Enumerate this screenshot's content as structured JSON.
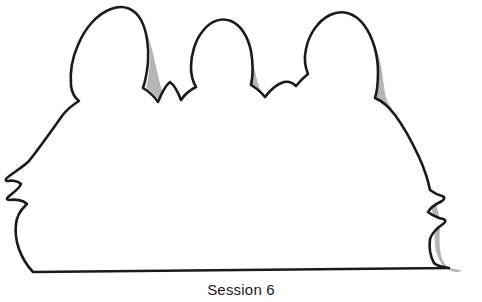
{
  "artwork": {
    "title": "three-figure-contour-silhouette",
    "description": "Hand-drawn contour line drawing of three seated figures seen as head-and-shoulder humps, with gray shadow offset along the right side of the outline",
    "background_color": "#ffffff",
    "outline_color": "#1a1a1a",
    "outline_width_px": 2.6,
    "shadow_color": "#b5b5b5",
    "shadow_width_px": 12,
    "fill_color": "#ffffff",
    "baseline": {
      "start_x": 33,
      "start_y": 272,
      "end_x": 449,
      "end_y": 268
    },
    "figures": [
      {
        "name": "figure-left",
        "label": "left head hump",
        "apex_x": 112,
        "apex_y": 8,
        "has_shadow": true
      },
      {
        "name": "figure-middle",
        "label": "middle head hump",
        "apex_x": 232,
        "apex_y": 22,
        "has_shadow": true
      },
      {
        "name": "figure-right",
        "label": "right head hump",
        "apex_x": 344,
        "apex_y": 13,
        "has_shadow": true
      }
    ],
    "profile_features": [
      {
        "name": "nose-bump",
        "x": 10,
        "y": 182
      },
      {
        "name": "lips-bump",
        "x": 8,
        "y": 200
      },
      {
        "name": "chin-curve",
        "x": 14,
        "y": 215
      }
    ]
  },
  "caption": {
    "text": "Session 6"
  },
  "paths": {
    "body_outline": "M 33 272 C 20 258 14 240 16 224 C 17 212 24 207 27 204 C 23 200 15 199 9 200 C 7 200 6 199 8 197 C 13 193 20 188 21 184 C 18 181 12 180 8 181 C 5 181 5 179 8 177 C 16 171 24 166 29 161 C 40 147 52 130 62 116 C 68 108 74 104 79 101 C 75 98 72 93 71 86 C 70 74 72 58 78 45 C 85 28 97 14 111 9 C 124 4 135 9 141 20 C 147 31 149 48 148 62 C 147 73 145 82 143 88 C 148 91 154 96 158 102 C 162 92 166 85 170 82 C 174 85 178 92 181 100 C 185 94 190 90 196 87 C 193 82 191 75 191 67 C 191 55 195 41 202 32 C 210 21 221 17 231 21 C 241 25 248 37 251 51 C 253 63 253 76 251 85 C 256 88 261 92 265 97 C 271 89 277 84 284 82 C 289 81 293 83 296 86 C 300 81 304 77 308 74 C 305 67 304 58 306 49 C 309 34 318 21 330 15 C 342 9 355 13 364 25 C 373 37 378 55 378 72 C 378 83 377 92 375 98 C 382 101 389 107 395 115 C 404 127 412 142 419 157 C 424 168 428 180 430 190 C 434 193 438 195 442 196 C 445 197 445 199 442 201 C 436 204 430 208 428 212 C 432 215 438 218 443 219 C 446 220 446 222 443 224 C 437 228 432 233 430 239 C 429 247 430 256 434 263 C 437 266 442 267 449 268 L 33 272 Z",
    "shadow_band": "M 141 20 C 147 31 152 47 155 62 C 159 80 162 93 165 99 C 169 105 173 108 176 110 C 172 112 168 110 164 105 C 158 98 152 92 146 88 C 148 82 149 73 150 62 C 151 48 148 31 141 20 Z M 251 51 C 253 63 256 77 259 86 C 263 98 268 106 273 110 C 277 113 281 113 285 111 C 281 116 275 116 269 112 C 262 107 256 100 252 92 C 251 88 250 86 249 85 C 251 76 253 63 251 51 Z M 364 25 C 373 37 380 55 382 72 C 384 86 385 95 387 100 C 391 109 398 118 405 130 C 414 146 422 164 428 181 C 432 192 435 201 437 208 C 439 214 440 219 440 224 C 440 232 439 241 440 249 C 441 258 444 265 449 268 C 456 269 460 270 462 271 C 458 273 452 272 447 269 C 440 264 436 255 435 245 C 434 236 435 227 434 220 C 433 213 431 206 428 198 C 423 184 416 168 408 153 C 400 138 392 124 385 114 C 381 108 378 104 375 101 C 377 94 378 84 378 72 C 378 55 373 37 364 25 Z"
  }
}
